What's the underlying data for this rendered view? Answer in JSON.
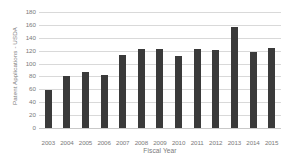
{
  "chart_data": {
    "type": "bar",
    "title": "",
    "subtitle": "",
    "xlabel": "Fiscal Year",
    "ylabel": "Patent Applications - USDA",
    "categories": [
      "2003",
      "2004",
      "2005",
      "2006",
      "2007",
      "2008",
      "2009",
      "2010",
      "2011",
      "2012",
      "2013",
      "2014",
      "2015"
    ],
    "values": [
      59,
      80,
      87,
      82,
      114,
      122,
      122,
      112,
      123,
      121,
      156,
      118,
      124
    ],
    "ylim": [
      0,
      180
    ],
    "ytick_step": 20,
    "yticks": [
      180,
      160,
      140,
      120,
      100,
      80,
      60,
      40,
      20,
      0
    ],
    "grid": "horizontal",
    "legend": "none",
    "annotations": [],
    "colors": {
      "bar": "#3a3a3a",
      "gridline": "#d9d9d9",
      "baseline": "#c9c9c9",
      "text": "#7a7a7a",
      "background": "#ffffff"
    }
  }
}
